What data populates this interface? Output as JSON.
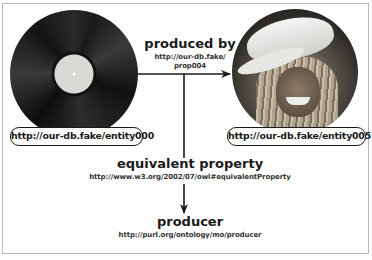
{
  "diagram": {
    "nodes": {
      "subject": {
        "image": "vinyl-record",
        "uri": "http://our-db.fake/entity000"
      },
      "object": {
        "image": "person-photo",
        "uri": "http://our-db.fake/entity005"
      }
    },
    "edges": {
      "produced_by": {
        "title": "produced by",
        "uri_line1": "http://our-db.fake/",
        "uri_line2": "prop004"
      }
    },
    "relations": {
      "equivalent_property": {
        "title": "equivalent property",
        "uri": "http://www.w3.org/2002/07/owl#equivalentProperty"
      },
      "producer": {
        "title": "producer",
        "uri": "http://purl.org/ontology/mo/producer"
      }
    },
    "colors": {
      "line": "#1a1a1a",
      "frame": "#b8b8b8",
      "background": "#ffffff"
    }
  }
}
